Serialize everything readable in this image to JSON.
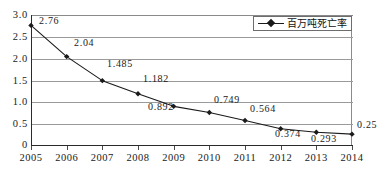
{
  "chart_data": {
    "type": "line",
    "title": "",
    "xlabel": "",
    "ylabel": "",
    "grid": true,
    "legend_position": "top-right",
    "x": [
      2005,
      2006,
      2007,
      2008,
      2009,
      2010,
      2011,
      2012,
      2013,
      2014
    ],
    "categories": [
      "2005",
      "2006",
      "2007",
      "2008",
      "2009",
      "2010",
      "2011",
      "2012",
      "2013",
      "2014"
    ],
    "series": [
      {
        "name": "百万吨死亡率",
        "marker": "diamond",
        "color": "#1a1a1a",
        "values": [
          2.76,
          2.04,
          1.485,
          1.182,
          0.892,
          0.749,
          0.564,
          0.374,
          0.293,
          0.25
        ]
      }
    ],
    "point_labels": [
      "2.76",
      "2.04",
      "1.485",
      "1.182",
      "0.892",
      "0.749",
      "0.564",
      "0.374",
      "0.293",
      "0.25"
    ],
    "ylim": [
      0,
      3.0
    ],
    "ytick_values": [
      3.0,
      2.5,
      2.0,
      1.5,
      1.0,
      0.5,
      0
    ],
    "ytick_labels": [
      "3.0",
      "2.5",
      "2.0",
      "1.5",
      "1.0",
      "0.5",
      "0"
    ],
    "xtick_labels": [
      "2005",
      "2006",
      "2007",
      "2008",
      "2009",
      "2010",
      "2011",
      "2012",
      "2013",
      "2014"
    ]
  },
  "axes": {
    "y": {
      "t0": "3.0",
      "t1": "2.5",
      "t2": "2.0",
      "t3": "1.5",
      "t4": "1.0",
      "t5": "0.5",
      "t6": "0"
    },
    "x": {
      "t0": "2005",
      "t1": "2006",
      "t2": "2007",
      "t3": "2008",
      "t4": "2009",
      "t5": "2010",
      "t6": "2011",
      "t7": "2012",
      "t8": "2013",
      "t9": "2014"
    }
  },
  "labels": {
    "p0": "2.76",
    "p1": "2.04",
    "p2": "1.485",
    "p3": "1.182",
    "p4": "0.892",
    "p5": "0.749",
    "p6": "0.564",
    "p7": "0.374",
    "p8": "0.293",
    "p9": "0.25"
  },
  "legend": {
    "series_label": "百万吨死亡率"
  },
  "colors": {
    "series": "#1a1a1a",
    "grid": "#9a9a9a",
    "axis": "#2b2b2b",
    "background": "#ffffff"
  }
}
